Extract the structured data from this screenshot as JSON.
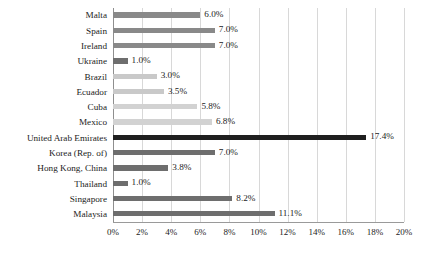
{
  "chart_data": {
    "type": "bar",
    "orientation": "horizontal",
    "title": "",
    "subtitle": "",
    "xlabel": "",
    "ylabel": "",
    "xlim": [
      0,
      20
    ],
    "xtick_step": 2,
    "grid": true,
    "legend": "none",
    "value_suffix": "%",
    "xticks": [
      "0%",
      "2%",
      "4%",
      "6%",
      "8%",
      "10%",
      "12%",
      "14%",
      "16%",
      "18%",
      "20%"
    ],
    "categories": [
      "Malta",
      "Spain",
      "Ireland",
      "Ukraine",
      "Brazil",
      "Ecuador",
      "Cuba",
      "Mexico",
      "United Arab Emirates",
      "Korea (Rep. of)",
      "Hong Kong, China",
      "Thailand",
      "Singapore",
      "Malaysia"
    ],
    "values": [
      6.0,
      7.0,
      7.0,
      1.0,
      3.0,
      3.5,
      5.8,
      6.8,
      17.4,
      7.0,
      3.8,
      1.0,
      8.2,
      11.1
    ],
    "labels": [
      "6.0%",
      "7.0%",
      "7.0%",
      "1.0%",
      "3.0%",
      "3.5%",
      "5.8%",
      "6.8%",
      "17.4%",
      "7.0%",
      "3.8%",
      "1.0%",
      "8.2%",
      "11.1%"
    ],
    "bar_colors": [
      "#898989",
      "#898989",
      "#898989",
      "#6e6e6e",
      "#c9c9c9",
      "#c9c9c9",
      "#d2d2d2",
      "#d2d2d2",
      "#1f1f1f",
      "#6e6e6e",
      "#6e6e6e",
      "#6e6e6e",
      "#6e6e6e",
      "#6e6e6e"
    ],
    "gridline_color": "#d8d8d8",
    "axis_color": "#9a9a9a",
    "text_color": "#1c1c1c",
    "background_color": "#ffffff"
  }
}
